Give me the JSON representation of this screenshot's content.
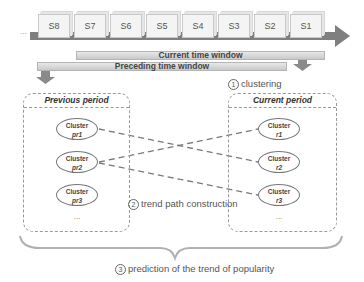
{
  "timeline": {
    "leading_ellipsis": "...",
    "slices": [
      "S8",
      "S7",
      "S6",
      "S5",
      "S4",
      "S3",
      "S2",
      "S1"
    ],
    "current_window_label": "Current time window",
    "preceding_window_label": "Preceding time window"
  },
  "steps": {
    "step1": {
      "number": "1",
      "label": "clustering"
    },
    "step2": {
      "number": "2",
      "label": "trend path construction"
    },
    "step3": {
      "number": "3",
      "label": "prediction of the trend of popularity"
    }
  },
  "previous_period": {
    "title": "Previous period",
    "clusters": [
      {
        "label": "Cluster",
        "id": "pr1"
      },
      {
        "label": "Cluster",
        "id": "pr2"
      },
      {
        "label": "Cluster",
        "id": "pr3"
      }
    ],
    "more": "..."
  },
  "current_period": {
    "title": "Current period",
    "clusters": [
      {
        "label": "Cluster",
        "id": "r1"
      },
      {
        "label": "Cluster",
        "id": "r2"
      },
      {
        "label": "Cluster",
        "id": "r3"
      }
    ],
    "more": "..."
  },
  "trend_links": [
    {
      "from": "pr1",
      "to": "r2"
    },
    {
      "from": "pr2",
      "to": "r1"
    },
    {
      "from": "pr2",
      "to": "r3"
    }
  ],
  "colors": {
    "timeline_arrow": "#7f7f7f",
    "window_bar": "#d0d0d0",
    "dashed_link": "#7a7a7a",
    "text": "#444444"
  }
}
